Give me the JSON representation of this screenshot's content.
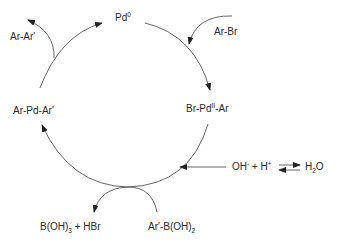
{
  "diagram": {
    "type": "catalytic-cycle",
    "colors": {
      "line": "#555555",
      "text": "#2a2a2a",
      "background": "#ffffff"
    },
    "nodes": {
      "pd0": {
        "base": "Pd",
        "sup": "0"
      },
      "oxidative_addition_product": {
        "pre": "Br-Pd",
        "sup": "II",
        "post": "-Ar"
      },
      "transmetalation_product": {
        "text": "Ar-Pd-Ar'"
      }
    },
    "reagents": {
      "aryl_bromide": {
        "text": "Ar-Br"
      },
      "product": {
        "text": "Ar-Ar'"
      },
      "boronic_acid": {
        "pre": "Ar'-B(OH)",
        "sub": "2"
      },
      "byproduct": {
        "pre": "B(OH)",
        "sub": "3",
        "post": " + HBr"
      },
      "base_equilibrium": {
        "hydroxide": {
          "base": "OH",
          "sup": "-"
        },
        "plus": " + ",
        "proton": {
          "base": "H",
          "sup": "+"
        },
        "water": {
          "pre": "H",
          "sub": "2",
          "post": "O"
        }
      }
    }
  }
}
